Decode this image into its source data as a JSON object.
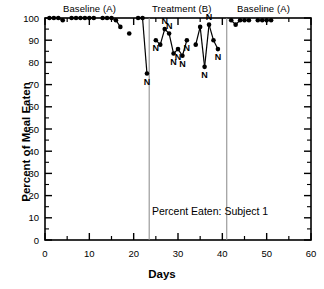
{
  "chart_data": {
    "type": "line",
    "title": "",
    "annotation": "Percent Eaten: Subject 1",
    "xlabel": "Days",
    "ylabel": "Percent of Meal Eaten",
    "xlim": [
      0,
      60
    ],
    "ylim": [
      0,
      100
    ],
    "x_major_ticks": [
      0,
      10,
      20,
      30,
      40,
      50,
      60
    ],
    "x_minor_ticks": [
      5,
      15,
      25,
      35,
      45,
      55
    ],
    "y_major_ticks": [
      0,
      10,
      20,
      30,
      40,
      50,
      60,
      70,
      80,
      90,
      100
    ],
    "grid": false,
    "legend": "none",
    "marker": "filled-circle",
    "point_label_symbol": "N",
    "point_label_meaning": "N",
    "phases": [
      {
        "label": "Baseline (A)",
        "start": 0,
        "end": 23.5,
        "label_x": 11.5
      },
      {
        "label": "Treatment (B)",
        "start": 23.5,
        "end": 41,
        "label_x": 32.0
      },
      {
        "label": "Baseline (A)",
        "start": 41,
        "end": 60,
        "label_x": 50.5
      }
    ],
    "phase_divider_days": [
      23.5,
      41.0
    ],
    "series": [
      {
        "name": "Percent of Meal Eaten",
        "points": [
          {
            "x": 1,
            "y": 100,
            "n": false
          },
          {
            "x": 2,
            "y": 100,
            "n": false
          },
          {
            "x": 3,
            "y": 100,
            "n": false
          },
          {
            "x": 4,
            "y": 99,
            "n": false
          },
          {
            "x": 6,
            "y": 100,
            "n": false
          },
          {
            "x": 7,
            "y": 100,
            "n": false
          },
          {
            "x": 8,
            "y": 100,
            "n": false
          },
          {
            "x": 9,
            "y": 100,
            "n": false
          },
          {
            "x": 10,
            "y": 100,
            "n": false
          },
          {
            "x": 11,
            "y": 100,
            "n": false
          },
          {
            "x": 13,
            "y": 100,
            "n": false
          },
          {
            "x": 14,
            "y": 100,
            "n": false
          },
          {
            "x": 15,
            "y": 100,
            "n": false
          },
          {
            "x": 16,
            "y": 99,
            "n": false
          },
          {
            "x": 17,
            "y": 96,
            "n": false
          },
          {
            "x": 19,
            "y": 93,
            "n": false
          },
          {
            "x": 21,
            "y": 100,
            "n": false
          },
          {
            "x": 22,
            "y": 100,
            "n": false
          },
          {
            "x": 23,
            "y": 75,
            "n": true
          },
          {
            "x": 25,
            "y": 90,
            "n": true
          },
          {
            "x": 26,
            "y": 88,
            "n": false
          },
          {
            "x": 27,
            "y": 95,
            "n": true
          },
          {
            "x": 28,
            "y": 93,
            "n": true
          },
          {
            "x": 29,
            "y": 84,
            "n": true
          },
          {
            "x": 30,
            "y": 86,
            "n": true
          },
          {
            "x": 31,
            "y": 83,
            "n": true
          },
          {
            "x": 32,
            "y": 90,
            "n": true
          },
          {
            "x": 34,
            "y": 88,
            "n": false
          },
          {
            "x": 35,
            "y": 96,
            "n": false
          },
          {
            "x": 36,
            "y": 78,
            "n": true
          },
          {
            "x": 37,
            "y": 97,
            "n": true
          },
          {
            "x": 38,
            "y": 90,
            "n": false
          },
          {
            "x": 39,
            "y": 86,
            "n": true
          },
          {
            "x": 42,
            "y": 99,
            "n": false
          },
          {
            "x": 43,
            "y": 97,
            "n": false
          },
          {
            "x": 44,
            "y": 99,
            "n": false
          },
          {
            "x": 45,
            "y": 99,
            "n": false
          },
          {
            "x": 46,
            "y": 99,
            "n": false
          },
          {
            "x": 48,
            "y": 99,
            "n": false
          },
          {
            "x": 49,
            "y": 99,
            "n": false
          },
          {
            "x": 50,
            "y": 99,
            "n": false
          },
          {
            "x": 51,
            "y": 99,
            "n": false
          }
        ]
      }
    ]
  }
}
